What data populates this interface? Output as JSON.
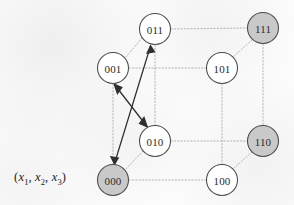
{
  "figure": {
    "type": "hypercube-graph",
    "axis_label": {
      "open_paren": "(",
      "var1": "x",
      "sub1": "1",
      "comma1": ",",
      "var2": "x",
      "sub2": "2",
      "comma2": ",",
      "var3": "x",
      "sub3": "3",
      "close_paren": ")"
    },
    "colors": {
      "node_fill": "#ffffff",
      "node_fill_shaded": "#c9c9c9",
      "node_stroke": "#4a4a4a",
      "edge": "#b5b5b5",
      "arrow": "#2f2f2f",
      "background": "#fcfcfc",
      "text": "#2b2b2b"
    },
    "nodes": [
      {
        "id": "011",
        "label": "011",
        "x": 155,
        "y": 29,
        "r": 15.5,
        "shaded": false
      },
      {
        "id": "111",
        "label": "111",
        "x": 263,
        "y": 28,
        "r": 15.5,
        "shaded": true
      },
      {
        "id": "001",
        "label": "001",
        "x": 113,
        "y": 68,
        "r": 15.5,
        "shaded": false
      },
      {
        "id": "101",
        "label": "101",
        "x": 222,
        "y": 68,
        "r": 15.5,
        "shaded": false
      },
      {
        "id": "010",
        "label": "010",
        "x": 155,
        "y": 141,
        "r": 15.5,
        "shaded": false
      },
      {
        "id": "110",
        "label": "110",
        "x": 263,
        "y": 141,
        "r": 15.5,
        "shaded": true
      },
      {
        "id": "000",
        "label": "000",
        "x": 113,
        "y": 180,
        "r": 15.5,
        "shaded": true
      },
      {
        "id": "100",
        "label": "100",
        "x": 222,
        "y": 180,
        "r": 15.5,
        "shaded": false
      }
    ],
    "edges": [
      {
        "from": "011",
        "to": "111",
        "style": "dotted"
      },
      {
        "from": "011",
        "to": "001",
        "style": "dotted"
      },
      {
        "from": "011",
        "to": "010",
        "style": "dotted"
      },
      {
        "from": "111",
        "to": "101",
        "style": "dotted"
      },
      {
        "from": "111",
        "to": "110",
        "style": "dotted"
      },
      {
        "from": "001",
        "to": "101",
        "style": "dotted"
      },
      {
        "from": "001",
        "to": "000",
        "style": "dotted"
      },
      {
        "from": "101",
        "to": "100",
        "style": "dotted"
      },
      {
        "from": "010",
        "to": "110",
        "style": "dotted"
      },
      {
        "from": "010",
        "to": "000",
        "style": "dotted"
      },
      {
        "from": "110",
        "to": "100",
        "style": "dotted"
      },
      {
        "from": "000",
        "to": "100",
        "style": "dotted"
      }
    ],
    "arrows": [
      {
        "from": "000",
        "to": "011",
        "style": "double-headed",
        "solid": true
      },
      {
        "from": "001",
        "to": "010",
        "style": "double-headed",
        "solid": true
      }
    ]
  }
}
